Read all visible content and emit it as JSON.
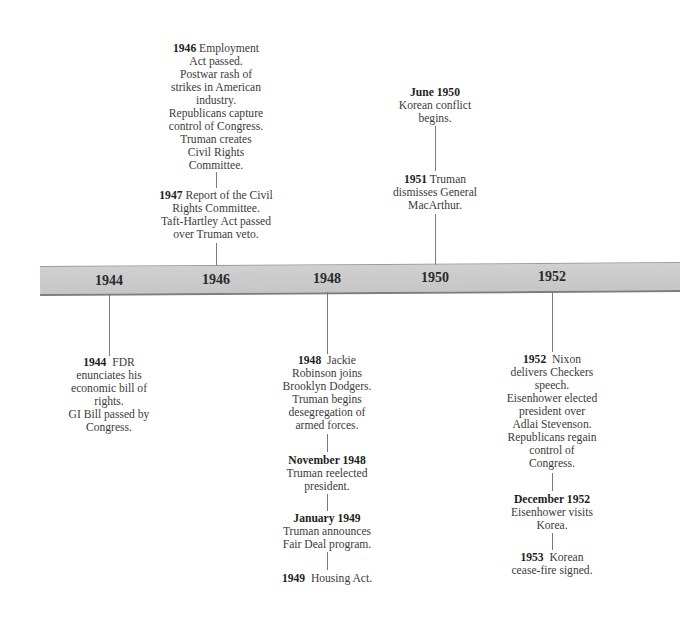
{
  "timeline": {
    "axis_years": [
      "1944",
      "1946",
      "1948",
      "1950",
      "1952"
    ],
    "bar_color": "#c9c9c9",
    "above": {
      "y1946": {
        "year": "1946",
        "lines": [
          "Employment",
          "Act passed.",
          "Postwar rash of",
          "strikes in American",
          "industry.",
          "Republicans capture",
          "control of Congress.",
          "Truman creates",
          "Civil Rights",
          "Committee."
        ]
      },
      "y1947": {
        "year": "1947",
        "lines": [
          "Report of the Civil",
          "Rights Committee.",
          "Taft-Hartley Act passed",
          "over Truman veto."
        ]
      },
      "jun1950": {
        "year": "June 1950",
        "lines": [
          "Korean conflict",
          "begins."
        ]
      },
      "y1951": {
        "year": "1951",
        "lines": [
          "Truman",
          "dismisses General",
          "MacArthur."
        ]
      }
    },
    "below": {
      "y1944": {
        "year": "1944",
        "lines": [
          "FDR",
          "enunciates his",
          "economic bill of",
          "rights.",
          "GI Bill passed by",
          "Congress."
        ]
      },
      "y1948": {
        "year": "1948",
        "lines": [
          "Jackie",
          "Robinson joins",
          "Brooklyn Dodgers.",
          "Truman begins",
          "desegregation of",
          "armed forces."
        ]
      },
      "nov1948": {
        "year": "November 1948",
        "lines": [
          "Truman reelected",
          "president."
        ]
      },
      "jan1949": {
        "year": "January 1949",
        "lines": [
          "Truman announces",
          "Fair Deal program."
        ]
      },
      "y1949": {
        "year": "1949",
        "lines": [
          "Housing Act."
        ]
      },
      "y1952": {
        "year": "1952",
        "lines": [
          "Nixon",
          "delivers Checkers",
          "speech.",
          "Eisenhower elected",
          "president over",
          "Adlai Stevenson.",
          "Republicans regain",
          "control of",
          "Congress."
        ]
      },
      "dec1952": {
        "year": "December 1952",
        "lines": [
          "Eisenhower visits",
          "Korea."
        ]
      },
      "y1953": {
        "year": "1953",
        "lines": [
          "Korean",
          "cease-fire signed."
        ]
      }
    }
  }
}
